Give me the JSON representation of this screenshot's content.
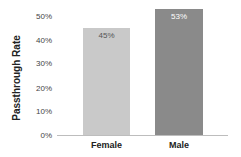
{
  "chart_data": {
    "type": "bar",
    "title": "",
    "xlabel": "",
    "ylabel": "Passthrough Rate",
    "categories": [
      "Female",
      "Male"
    ],
    "values": [
      45,
      53
    ],
    "value_labels": [
      "45%",
      "53%"
    ],
    "ylim": [
      0,
      55
    ],
    "yticks": [
      "0%",
      "10%",
      "20%",
      "30%",
      "40%",
      "50%"
    ],
    "grid": false,
    "legend": null,
    "colors": [
      "#c9c9c9",
      "#8a8a8a"
    ],
    "label_colors": [
      "#555555",
      "#ffffff"
    ]
  }
}
